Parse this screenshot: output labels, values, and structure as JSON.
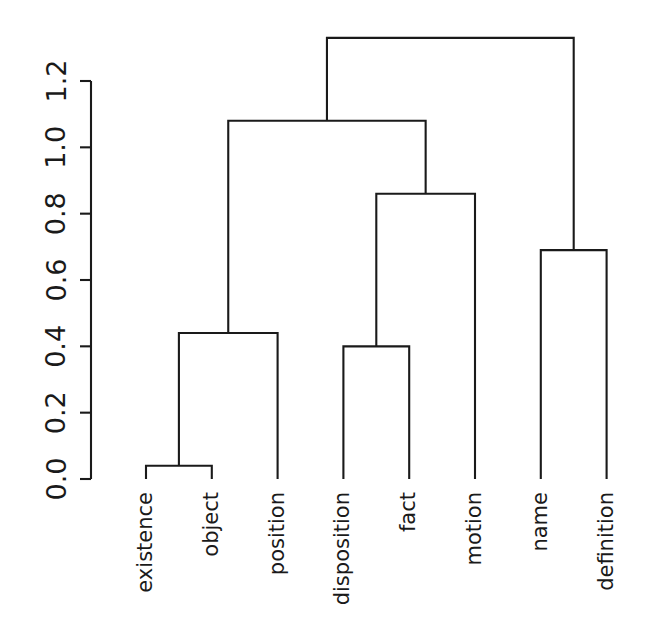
{
  "chart_data": {
    "type": "dendrogram",
    "title": "",
    "xlabel": "",
    "ylabel": "",
    "ylim": [
      0.0,
      1.33
    ],
    "grid": false,
    "legend": null,
    "y_axis": {
      "ticks": [
        0.0,
        0.2,
        0.4,
        0.6,
        0.8,
        1.0,
        1.2
      ],
      "tick_labels": [
        "0.0",
        "0.2",
        "0.4",
        "0.6",
        "0.8",
        "1.0",
        "1.2"
      ],
      "orientation": "rotated-90"
    },
    "leaves": [
      {
        "label": "existence",
        "order": 1
      },
      {
        "label": "object",
        "order": 2
      },
      {
        "label": "position",
        "order": 3
      },
      {
        "label": "disposition",
        "order": 4
      },
      {
        "label": "fact",
        "order": 5
      },
      {
        "label": "motion",
        "order": 6
      },
      {
        "label": "name",
        "order": 7
      },
      {
        "label": "definition",
        "order": 8
      }
    ],
    "merges": [
      {
        "id": "m1",
        "children": [
          "existence",
          "object"
        ],
        "height": 0.04
      },
      {
        "id": "m2",
        "children": [
          "m1",
          "position"
        ],
        "height": 0.44
      },
      {
        "id": "m3",
        "children": [
          "disposition",
          "fact"
        ],
        "height": 0.4
      },
      {
        "id": "m4",
        "children": [
          "m3",
          "motion"
        ],
        "height": 0.86
      },
      {
        "id": "m5",
        "children": [
          "m2",
          "m4"
        ],
        "height": 1.08
      },
      {
        "id": "m6",
        "children": [
          "name",
          "definition"
        ],
        "height": 0.69
      },
      {
        "id": "m7",
        "children": [
          "m5",
          "m6"
        ],
        "height": 1.33
      }
    ]
  },
  "axis_labels": [
    "0.0",
    "0.2",
    "0.4",
    "0.6",
    "0.8",
    "1.0",
    "1.2"
  ],
  "leaf_labels": [
    "existence",
    "object",
    "position",
    "disposition",
    "fact",
    "motion",
    "name",
    "definition"
  ],
  "colors": {
    "ink": "#1a1a1a",
    "background": "#ffffff"
  }
}
